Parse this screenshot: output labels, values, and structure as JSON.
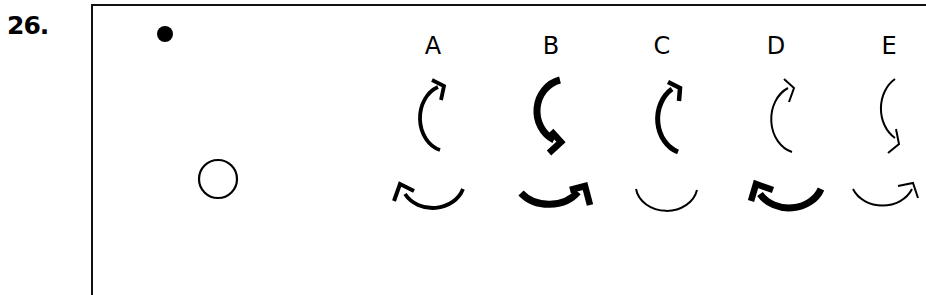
{
  "question": {
    "number": "26."
  },
  "stimulus": {
    "filled_dot": {
      "cx": 165,
      "cy": 34,
      "r": 8
    },
    "open_circle": {
      "cx": 218,
      "cy": 179,
      "r": 20
    }
  },
  "options": [
    {
      "label": "A",
      "x": 433
    },
    {
      "label": "B",
      "x": 551
    },
    {
      "label": "C",
      "x": 662
    },
    {
      "label": "D",
      "x": 776
    },
    {
      "label": "E",
      "x": 889
    }
  ]
}
